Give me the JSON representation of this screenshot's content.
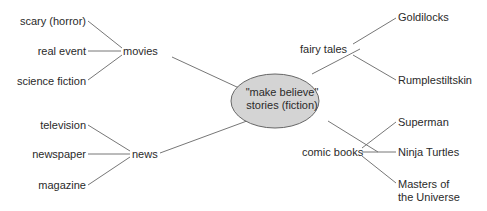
{
  "center": {
    "line1": "\"make believe\"",
    "line2": "stories (fiction)",
    "fill": "#d4d4d4"
  },
  "branches": {
    "movies": {
      "label": "movies",
      "children": [
        "scary (horror)",
        "real event",
        "science fiction"
      ]
    },
    "news": {
      "label": "news",
      "children": [
        "television",
        "newspaper",
        "magazine"
      ]
    },
    "fairy_tales": {
      "label": "fairy tales",
      "children": [
        "Goldilocks",
        "Rumplestiltskin"
      ]
    },
    "comic_books": {
      "label": "comic books",
      "children": [
        "Superman",
        "Ninja Turtles",
        "Masters of",
        "the Universe"
      ]
    }
  },
  "line_color": "#777777"
}
